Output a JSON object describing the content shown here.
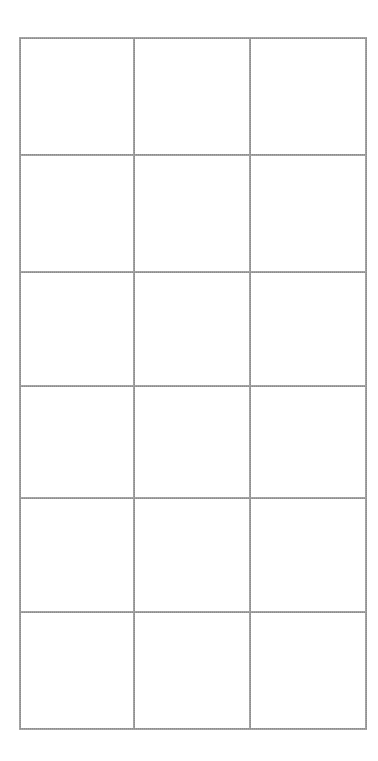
{
  "document": {
    "kind": "blank-grid-table",
    "background_color": "#ffffff",
    "line_color": "#8c8c8c",
    "line_width_px": 3
  },
  "table": {
    "name": "blank-grid",
    "rows": 6,
    "columns": 3,
    "has_header_row": false,
    "bounds": {
      "left": 19,
      "top": 37,
      "width": 340,
      "height": 693
    },
    "column_widths": [
      112,
      114,
      114
    ],
    "row_heights": [
      118,
      117,
      114,
      113,
      114,
      117
    ],
    "vertical_divider_x": [
      131,
      245
    ],
    "horizontal_divider_y": [
      155,
      272,
      386,
      499,
      613
    ],
    "cells": [
      [
        "",
        "",
        ""
      ],
      [
        "",
        "",
        ""
      ],
      [
        "",
        "",
        ""
      ],
      [
        "",
        "",
        ""
      ],
      [
        "",
        "",
        ""
      ],
      [
        "",
        "",
        ""
      ]
    ]
  }
}
